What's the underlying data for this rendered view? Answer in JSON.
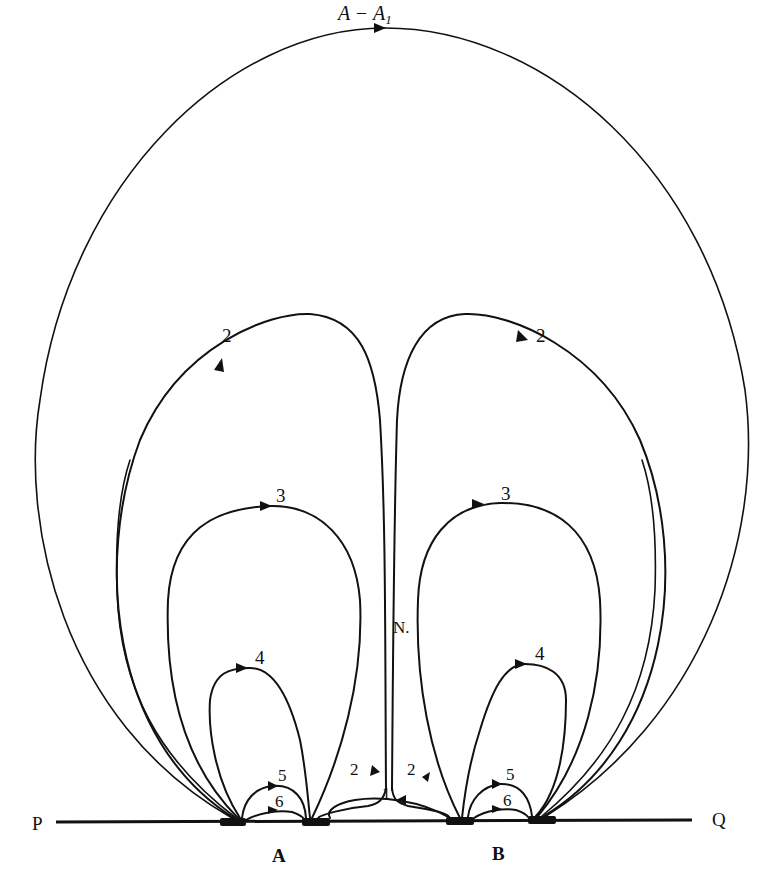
{
  "figure": {
    "title_label": "A − A",
    "title_subscript": "1",
    "colors": {
      "ink": "#111111",
      "background": "#ffffff"
    }
  },
  "baseline": {
    "left_label": "P",
    "right_label": "Q"
  },
  "electrodes": [
    {
      "name": "A",
      "label": "A"
    },
    {
      "name": "B",
      "label": "B"
    }
  ],
  "point_labels": {
    "neutral_point": "N."
  },
  "line_labels": {
    "outer": "A − A1",
    "loop2_left": "2",
    "loop2_right": "2",
    "loop3_left": "3",
    "loop3_right": "3",
    "loop4_left": "4",
    "loop4_right": "4",
    "loop5_left": "5",
    "loop5_right": "5",
    "loop6_left": "6",
    "loop6_right": "6",
    "line1": "1",
    "branch2_left": "2",
    "branch2_right": "2"
  }
}
